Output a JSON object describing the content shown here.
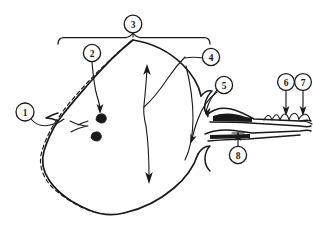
{
  "figure": {
    "background_color": "#ffffff",
    "ink_color": "#1a1a1a",
    "width": 313,
    "height": 234
  },
  "callouts": [
    {
      "id": "1",
      "label": "1",
      "cx": 25,
      "cy": 112,
      "r": 9.0
    },
    {
      "id": "2",
      "label": "2",
      "cx": 92,
      "cy": 53,
      "r": 8.6
    },
    {
      "id": "3",
      "label": "3",
      "cx": 133,
      "cy": 24,
      "r": 8.8
    },
    {
      "id": "4",
      "label": "4",
      "cx": 211,
      "cy": 57,
      "r": 8.6
    },
    {
      "id": "5",
      "label": "5",
      "cx": 224,
      "cy": 85,
      "r": 8.6
    },
    {
      "id": "6",
      "label": "6",
      "cx": 286,
      "cy": 82,
      "r": 8.4
    },
    {
      "id": "7",
      "label": "7",
      "cx": 303,
      "cy": 82,
      "r": 8.4
    },
    {
      "id": "8",
      "label": "8",
      "cx": 238,
      "cy": 155,
      "r": 8.6
    }
  ],
  "annotations": {
    "span_bracket": "horizontal span bracket across top of body",
    "center_double_arrow": "vertical double-headed arrow through body center",
    "dashed_guide": "dashed line parallel to lower-left outline",
    "nodules": "two small dark nodules inside body",
    "tail": "tapering feathered tail extending to the right"
  }
}
